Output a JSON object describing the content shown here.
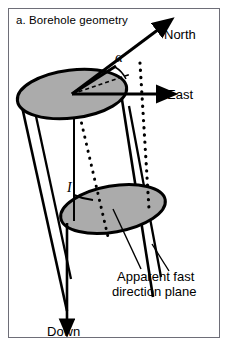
{
  "figure": {
    "caption": "a. Borehole geometry",
    "panel_border_color": "#6e6e78",
    "background_color": "#ffffff"
  },
  "diagram": {
    "type": "borehole-geometry-schematic",
    "fill_color": "#ababab",
    "stroke_color": "#000000",
    "labels": {
      "north": "North",
      "east": "East",
      "down": "Down",
      "azimuth_angle": "α",
      "inclination_angle": "I",
      "apparent_plane_line1": "Apparent fast",
      "apparent_plane_line2": "direction plane"
    },
    "elements": {
      "top_ellipse": "borehole-top-cross-section",
      "bottom_ellipse": "borehole-lower-cross-section",
      "cylinder": "borehole-cylinder",
      "north_axis": "north-arrow",
      "east_axis": "east-arrow",
      "down_axis": "down-arrow",
      "dotted_vertical": "vertical-reference-dotted-line",
      "dotted_plane_trace": "apparent-fast-direction-plane-dotted-trace"
    }
  }
}
